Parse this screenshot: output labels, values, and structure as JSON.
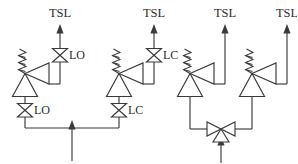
{
  "diagram": {
    "type": "piping-and-instrumentation-diagram",
    "connector_word": "or",
    "line_color": "#3a3a3a",
    "background_color": "#ffffff",
    "text_color": "#2b2b2b",
    "arrangements": [
      {
        "id": "left",
        "name": "two-parallel-legs-with-block-valves",
        "inlet": {
          "label": "",
          "direction": "up",
          "description": "single inlet arrow feeding a horizontal header"
        },
        "legs": [
          {
            "id": "left-leg",
            "outlet_label": "TSL",
            "outlet_direction": "up",
            "upper_valve_tag": "LO",
            "upper_valve_type": "gate-valve",
            "lower_valve_tag": "LO",
            "lower_valve_type": "gate-valve",
            "control_valve_type": "spring-diaphragm-control-valve",
            "control_valve_actuator": "spring-return"
          },
          {
            "id": "right-leg",
            "outlet_label": "TSL",
            "outlet_direction": "up",
            "upper_valve_tag": "LC",
            "upper_valve_type": "gate-valve",
            "lower_valve_tag": "LC",
            "lower_valve_type": "gate-valve",
            "control_valve_type": "spring-diaphragm-control-valve",
            "control_valve_actuator": "spring-return"
          }
        ]
      },
      {
        "id": "right",
        "name": "three-way-valve-arrangement",
        "inlet": {
          "label": "",
          "direction": "up",
          "description": "single inlet arrow feeding a three-way valve"
        },
        "selector_valve": {
          "type": "three-way-valve",
          "tag": "",
          "ports": 3
        },
        "legs": [
          {
            "id": "left-leg",
            "outlet_label": "TSL",
            "outlet_direction": "up",
            "upper_valve_tag": "",
            "lower_valve_tag": "",
            "control_valve_type": "spring-diaphragm-control-valve",
            "control_valve_actuator": "spring-return"
          },
          {
            "id": "right-leg",
            "outlet_label": "TSL",
            "outlet_direction": "up",
            "upper_valve_tag": "",
            "lower_valve_tag": "",
            "control_valve_type": "spring-diaphragm-control-valve",
            "control_valve_actuator": "spring-return"
          }
        ]
      }
    ],
    "labels": {
      "tsl_1": "TSL",
      "tsl_2": "TSL",
      "tsl_3": "TSL",
      "tsl_4": "TSL",
      "tag_lo_upper": "LO",
      "tag_lc_upper": "LC",
      "tag_lo_lower": "LO",
      "tag_lc_lower": "LC",
      "or": "or"
    }
  }
}
